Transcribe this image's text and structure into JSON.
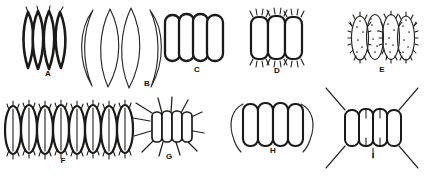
{
  "plate": {
    "title": "Plate of algal coenobia (Scenedesmus-type) line drawings",
    "background_color": "#ffffff",
    "ink_color": "#1c1a18",
    "width": 433,
    "height": 178,
    "figure_count": 9,
    "label_font_size": 8
  },
  "figures": [
    {
      "id": "A",
      "label": "A",
      "label_x": 48,
      "label_y": 76,
      "cell_count": 4,
      "cell_shape": "fusiform-acuminate",
      "ornament": "none",
      "description": "Flat coenobium of four narrow spindle-shaped cells with sharply pointed apices, thick dark outlines",
      "center_x": 46,
      "center_y": 40,
      "width": 48,
      "height": 58
    },
    {
      "id": "B",
      "label": "B",
      "label_x": 147,
      "label_y": 86,
      "cell_count": 4,
      "cell_shape": "lunate-crescent",
      "ornament": "none",
      "description": "Large coenobium of four strongly curved crescent-shaped cells with attenuated horn-like tips, thin outlines",
      "center_x": 118,
      "center_y": 45,
      "width": 88,
      "height": 82
    },
    {
      "id": "C",
      "label": "C",
      "label_x": 197,
      "label_y": 72,
      "cell_count": 4,
      "cell_shape": "oblong-cylindric",
      "ornament": "none",
      "description": "Four smooth oblong cells with broadly rounded poles arranged in a single flat series",
      "center_x": 194,
      "center_y": 38,
      "width": 62,
      "height": 48
    },
    {
      "id": "D",
      "label": "D",
      "label_x": 277,
      "label_y": 73,
      "cell_count": 3,
      "cell_shape": "oblong",
      "ornament": "short-setae-at-poles",
      "description": "Three oblong cells each bearing short bristles at the upper and lower poles",
      "center_x": 277,
      "center_y": 38,
      "width": 58,
      "height": 52
    },
    {
      "id": "E",
      "label": "E",
      "label_x": 382,
      "label_y": 72,
      "cell_count": 4,
      "cell_shape": "ellipsoid",
      "ornament": "granulate-and-marginal-spines",
      "description": "Four ellipsoid cells with punctate granular contents and fine spines around the whole margin",
      "center_x": 383,
      "center_y": 38,
      "width": 66,
      "height": 52
    },
    {
      "id": "F",
      "label": "F",
      "label_x": 63,
      "label_y": 160,
      "cell_count": 8,
      "cell_shape": "narrow-ellipsoid",
      "ornament": "short-setae-at-poles",
      "description": "Long coenobium of eight narrow ellipsoid cells with internal longitudinal lines and short bristles at both poles",
      "center_x": 70,
      "center_y": 130,
      "width": 132,
      "height": 54
    },
    {
      "id": "G",
      "label": "G",
      "label_x": 169,
      "label_y": 157,
      "cell_count": 4,
      "cell_shape": "oblong",
      "ornament": "long-radiating-bristles",
      "description": "Four oblong cells with numerous long bristles radiating from the corners and poles",
      "center_x": 169,
      "center_y": 126,
      "width": 70,
      "height": 62
    },
    {
      "id": "H",
      "label": "H",
      "label_x": 273,
      "label_y": 152,
      "cell_count": 4,
      "cell_shape": "oblong-cylindric",
      "ornament": "two-long-marginal-bristles",
      "description": "Four oblong cells flanked by a pair of very long curved bristles along the outer cells",
      "center_x": 272,
      "center_y": 125,
      "width": 72,
      "height": 58
    },
    {
      "id": "I",
      "label": "I",
      "label_x": 373,
      "label_y": 156,
      "cell_count": 4,
      "cell_shape": "oblong",
      "ornament": "four-long-polar-spines-plus-short-inner-spines",
      "description": "Four oblong cells bearing four long divergent spines from the outer cell poles and short spines on inner cells",
      "center_x": 372,
      "center_y": 128,
      "width": 96,
      "height": 74
    }
  ]
}
